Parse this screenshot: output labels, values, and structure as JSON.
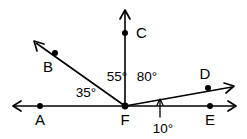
{
  "diagram": {
    "type": "geometry-angle-diagram",
    "width": 247,
    "height": 139,
    "background_color": "#ffffff",
    "stroke_color": "#000000",
    "vertex": {
      "name": "F",
      "label": "F",
      "x": 125,
      "y": 106
    },
    "points": [
      {
        "id": "A",
        "label": "A",
        "x": 40,
        "y": 106,
        "label_x": 40,
        "label_y": 125,
        "on": "ray-FA"
      },
      {
        "id": "B",
        "label": "B",
        "x": 55,
        "y": 53,
        "label_x": 48,
        "label_y": 72,
        "on": "ray-FB"
      },
      {
        "id": "C",
        "label": "C",
        "x": 125,
        "y": 33,
        "label_x": 136,
        "label_y": 38,
        "on": "ray-FC"
      },
      {
        "id": "D",
        "label": "D",
        "x": 208,
        "y": 88,
        "label_x": 205,
        "label_y": 79,
        "on": "ray-FD"
      },
      {
        "id": "E",
        "label": "E",
        "x": 210,
        "y": 106,
        "label_x": 210,
        "label_y": 125,
        "on": "ray-FE"
      },
      {
        "id": "F",
        "label": "F",
        "x": 125,
        "y": 106,
        "label_x": 125,
        "label_y": 125,
        "on": "vertex"
      }
    ],
    "rays": [
      {
        "id": "ray-FA",
        "from": "F",
        "through": "A",
        "direction": "left",
        "arrow": true
      },
      {
        "id": "ray-FB",
        "from": "F",
        "through": "B",
        "direction": "upper-left",
        "arrow": true
      },
      {
        "id": "ray-FC",
        "from": "F",
        "through": "C",
        "direction": "up",
        "arrow": true
      },
      {
        "id": "ray-FD",
        "from": "F",
        "through": "D",
        "direction": "upper-right",
        "arrow": true
      },
      {
        "id": "ray-FE",
        "from": "F",
        "through": "E",
        "direction": "right",
        "arrow": true
      }
    ],
    "angles": [
      {
        "id": "angle-AFB",
        "value": "35°",
        "between": "FA and FB",
        "label_x": 86,
        "label_y": 97
      },
      {
        "id": "angle-BFC",
        "value": "55°",
        "between": "FB and FC",
        "label_x": 117,
        "label_y": 81
      },
      {
        "id": "angle-CFD",
        "value": "80°",
        "between": "FC and FD",
        "label_x": 147,
        "label_y": 81
      },
      {
        "id": "angle-DFE",
        "value": "10°",
        "between": "FD and FE",
        "label_x": 163,
        "label_y": 133
      }
    ],
    "tick": {
      "id": "angle-DFE-pointer",
      "x": 160,
      "y_top": 100,
      "y_bottom": 117
    }
  }
}
